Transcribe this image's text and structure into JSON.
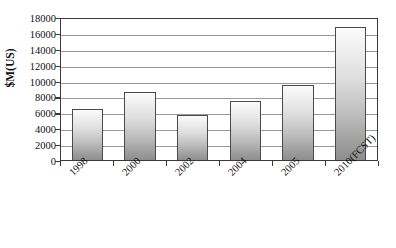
{
  "chart_data": {
    "type": "bar",
    "title": "",
    "subtitle": "",
    "xlabel": "",
    "ylabel": "$M(US)",
    "categories": [
      "1998",
      "2000",
      "2002",
      "2004",
      "2005",
      "2010(FCST)"
    ],
    "values": [
      6400,
      8550,
      5650,
      7450,
      9450,
      16750
    ],
    "series": [
      {
        "name": "",
        "values": [
          6400,
          8550,
          5650,
          7450,
          9450,
          16750
        ]
      }
    ],
    "ylim": [
      0,
      18000
    ],
    "y_tick_step": 2000,
    "y_tick_labels": [
      "18000",
      "16000",
      "14000",
      "12000",
      "10000",
      "8000",
      "6000",
      "4000",
      "2000",
      "0"
    ],
    "y_tick_values": [
      18000,
      16000,
      14000,
      12000,
      10000,
      8000,
      6000,
      4000,
      2000,
      0
    ],
    "grid": true,
    "grid_axis": "y",
    "legend": false,
    "legend_position": "none",
    "x_label_rotation": -45,
    "bar_fill_top_color": "#fbfbfb",
    "bar_fill_bottom_color": "#8e8e8e",
    "bar_border_color": "#4a4a4a",
    "gridline_color": "#9a9a9a",
    "axis_color": "#3a3a3a",
    "background_color": "#ffffff",
    "text_color": "#111111"
  }
}
